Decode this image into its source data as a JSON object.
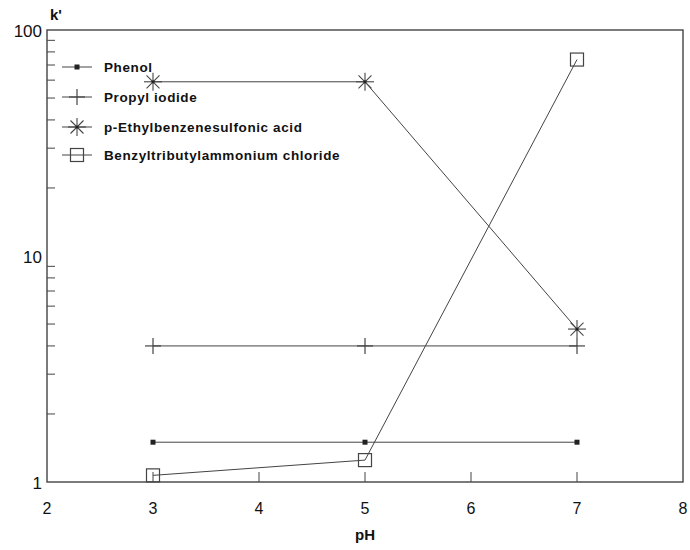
{
  "chart_data": {
    "type": "line",
    "title": "",
    "xlabel": "pH",
    "ylabel": "k'",
    "xlim": [
      2,
      8
    ],
    "ylim": [
      1,
      100
    ],
    "yscale": "log",
    "xticks": [
      2,
      3,
      4,
      5,
      6,
      7,
      8
    ],
    "yticks": [
      1,
      10,
      100
    ],
    "ytick_labels": [
      "1",
      "10",
      "100"
    ],
    "grid": false,
    "legend_position": "upper-left",
    "x": [
      3,
      5,
      7
    ],
    "series": [
      {
        "name": "Phenol",
        "marker": "dot",
        "values": [
          1.5,
          1.5,
          1.5
        ]
      },
      {
        "name": "Propyl iodide",
        "marker": "plus",
        "values": [
          4.0,
          4.0,
          4.0
        ]
      },
      {
        "name": "p-Ethylbenzenesulfonic acid",
        "marker": "asterisk",
        "values": [
          59,
          59,
          4.75
        ]
      },
      {
        "name": "Benzyltributylammonium chloride",
        "marker": "square",
        "values": [
          1.07,
          1.25,
          74
        ]
      }
    ]
  }
}
